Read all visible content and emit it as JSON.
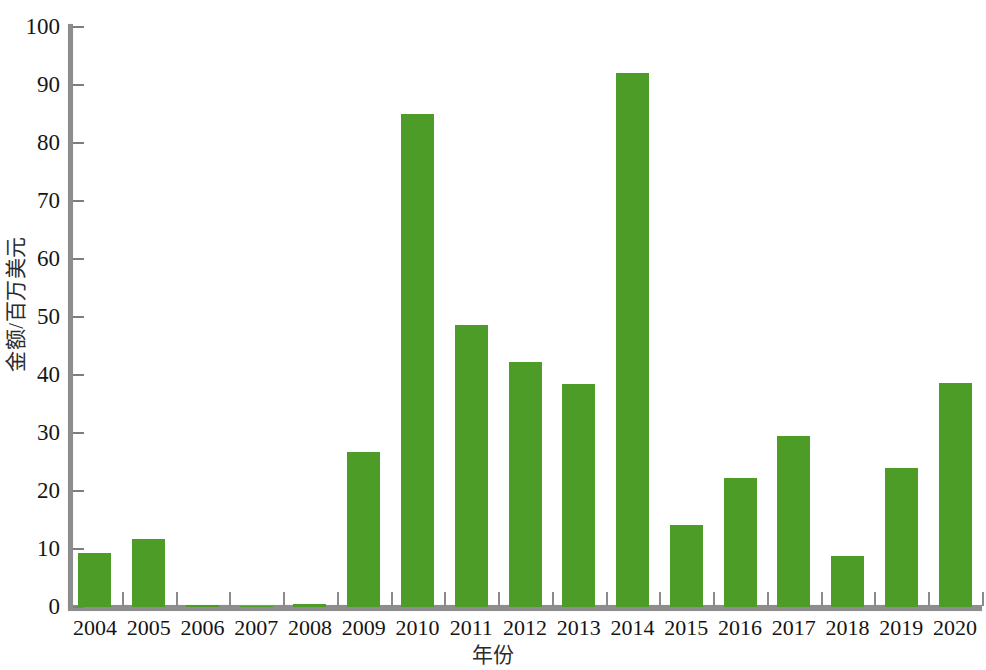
{
  "chart_data": {
    "type": "bar",
    "title": "",
    "subtitle": "",
    "xlabel": "年份",
    "ylabel": "金额/百万美元",
    "categories": [
      "2004",
      "2005",
      "2006",
      "2007",
      "2008",
      "2009",
      "2010",
      "2011",
      "2012",
      "2013",
      "2014",
      "2015",
      "2016",
      "2017",
      "2018",
      "2019",
      "2020"
    ],
    "values": [
      9.3,
      11.7,
      0.3,
      0.1,
      0.5,
      26.7,
      85.0,
      48.6,
      42.3,
      38.5,
      92.0,
      14.2,
      22.2,
      29.4,
      8.8,
      24.0,
      38.7
    ],
    "series": [
      {
        "name": "金额",
        "values": [
          9.3,
          11.7,
          0.3,
          0.1,
          0.5,
          26.7,
          85.0,
          48.6,
          42.3,
          38.5,
          92.0,
          14.2,
          22.2,
          29.4,
          8.8,
          24.0,
          38.7
        ]
      }
    ],
    "ylim": [
      0,
      100
    ],
    "ytick_labels": [
      "0",
      "10",
      "20",
      "30",
      "40",
      "50",
      "60",
      "70",
      "80",
      "90",
      "100"
    ],
    "ytick_values": [
      0,
      10,
      20,
      30,
      40,
      50,
      60,
      70,
      80,
      90,
      100
    ],
    "grid": false,
    "legend": false,
    "legend_position": "none",
    "bar_color": "#4e9c28",
    "axis_color": "#8d8d8d",
    "background_color": "#ffffff"
  }
}
